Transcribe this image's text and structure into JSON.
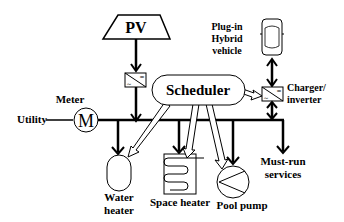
{
  "diagram": {
    "nodes": {
      "pv": {
        "label": "PV"
      },
      "scheduler": {
        "label": "Scheduler"
      },
      "meter": {
        "label": "Meter",
        "symbol": "M"
      },
      "utility": {
        "label": "Utility"
      },
      "vehicle": {
        "label_lines": [
          "Plug-in",
          "Hybrid",
          "vehicle"
        ]
      },
      "charger": {
        "label_lines": [
          "Charger/",
          "inverter"
        ]
      },
      "water_heater": {
        "label_lines": [
          "Water",
          "heater"
        ]
      },
      "space_heater": {
        "label": "Space heater"
      },
      "pool_pump": {
        "label": "Pool pump"
      },
      "must_run": {
        "label_lines": [
          "Must-run",
          "services"
        ]
      }
    },
    "converter_symbols": {
      "dc": "=",
      "ac": "~"
    },
    "colors": {
      "stroke": "#000000",
      "fill": "#ffffff"
    }
  }
}
